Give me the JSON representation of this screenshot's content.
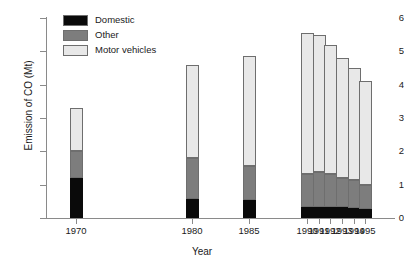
{
  "chart_data": {
    "type": "bar",
    "subtype": "stacked",
    "title": "",
    "xlabel": "Year",
    "ylabel": "Emission of CO (Mt)",
    "categories": [
      "1970",
      "1980",
      "1985",
      "1990",
      "1991",
      "1992",
      "1993",
      "1994",
      "1995"
    ],
    "x_positions": [
      1970,
      1980,
      1985,
      1990,
      1991,
      1992,
      1993,
      1994,
      1995
    ],
    "xlim": [
      1967.5,
      1997.5
    ],
    "ylim": [
      0,
      6
    ],
    "y_ticks": [
      0,
      1,
      2,
      3,
      4,
      5,
      6
    ],
    "y_tick_labels": [
      "0",
      "1",
      "2",
      "3",
      "4",
      "5",
      "6"
    ],
    "grid": false,
    "legend_position": "top-left",
    "series": [
      {
        "name": "Domestic",
        "color": "#0a0a0a",
        "values": [
          1.2,
          0.57,
          0.55,
          0.33,
          0.33,
          0.33,
          0.33,
          0.3,
          0.28
        ]
      },
      {
        "name": "Other",
        "color": "#7d7d7d",
        "values": [
          0.8,
          1.23,
          1.02,
          1.0,
          1.04,
          1.0,
          0.87,
          0.85,
          0.72
        ]
      },
      {
        "name": "Motor vehicles",
        "color": "#e8e8e8",
        "values": [
          1.3,
          2.8,
          3.28,
          4.22,
          4.13,
          3.87,
          3.6,
          3.35,
          3.1
        ]
      }
    ],
    "totals": [
      3.3,
      4.6,
      4.85,
      5.55,
      5.5,
      5.2,
      4.8,
      4.5,
      4.1
    ]
  },
  "legend": {
    "items": [
      {
        "label": "Domestic"
      },
      {
        "label": "Other"
      },
      {
        "label": "Motor vehicles"
      }
    ]
  }
}
